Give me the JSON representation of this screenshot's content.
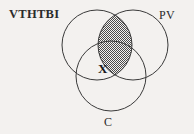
{
  "diagram": {
    "type": "venn",
    "background_color": "#f3f1ef",
    "stroke_color": "#3a3a3a",
    "shade_color": "#4a4a4a",
    "sets": [
      {
        "id": "left",
        "label": "VTHTBI",
        "cx": 97,
        "cy": 45,
        "r": 35
      },
      {
        "id": "right",
        "label": "PV",
        "cx": 133,
        "cy": 45,
        "r": 35
      },
      {
        "id": "bottom",
        "label": "C",
        "cx": 111,
        "cy": 76,
        "r": 35
      }
    ],
    "shaded_region": {
      "name": "left-right-intersection",
      "description": "lens where VTHTBI and PV overlap",
      "fill": "crosshatch-dark-gray"
    },
    "markers": [
      {
        "id": "x-marker",
        "text": "X",
        "x": 104,
        "y": 70,
        "region": "triple-intersection-edge"
      }
    ]
  }
}
